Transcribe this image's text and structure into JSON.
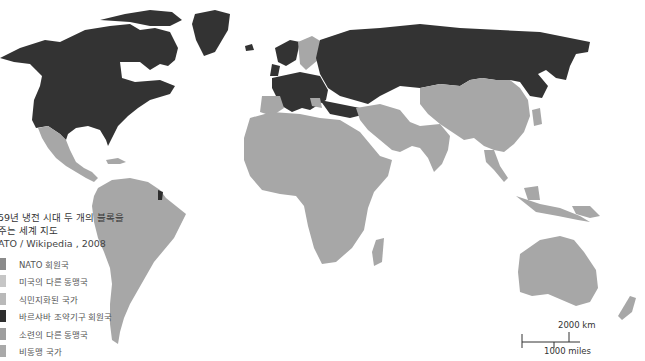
{
  "legend": {
    "title_line1": "59년 냉전 시대 두 개의 블록을",
    "title_line2": "주는 세계 지도",
    "source": "ATO / Wikipedia , 2008",
    "items": [
      {
        "label": "NATO 회원국",
        "color": "#8a8a8a"
      },
      {
        "label": "미국의 다른 동맹국",
        "color": "#c6c6c6"
      },
      {
        "label": "식민지화된 국가",
        "color": "#b9b9b9"
      },
      {
        "label": "바르샤바 조약기구 회원국",
        "color": "#2e2e2e"
      },
      {
        "label": "소련의 다른 동맹국",
        "color": "#9e9e9e"
      },
      {
        "label": "비동맹 국가",
        "color": "#a9a9a9"
      }
    ]
  },
  "scale": {
    "km_label": "2000 km",
    "miles_label": "1000 miles"
  },
  "colors": {
    "warsaw": "#333333",
    "nato": "#333333",
    "other": "#a7a7a7",
    "background": "#ffffff"
  }
}
